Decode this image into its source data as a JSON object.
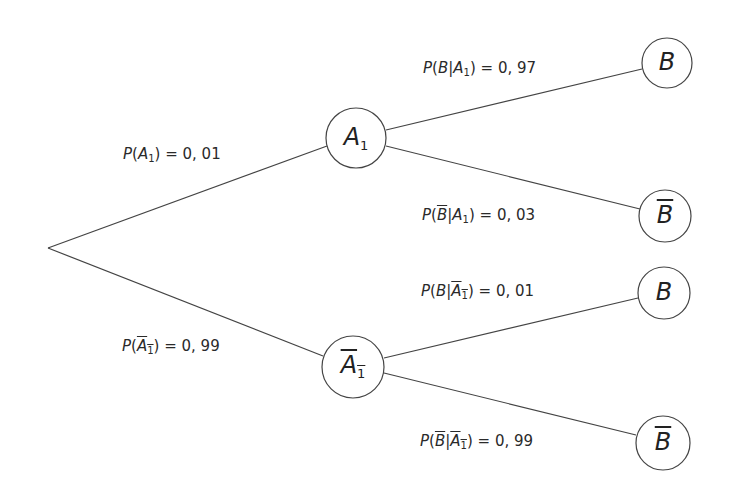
{
  "diagram": {
    "type": "probability-tree",
    "root": {
      "x": 48,
      "y": 248
    },
    "nodes": [
      {
        "id": "A1",
        "label": "A",
        "sub": "1",
        "overline": false,
        "x": 356,
        "y": 138,
        "r": 30
      },
      {
        "id": "notA1",
        "label": "A",
        "sub": "1",
        "overline": true,
        "x": 353,
        "y": 367,
        "r": 31
      },
      {
        "id": "B_A1",
        "label": "B",
        "overline": false,
        "x": 667,
        "y": 63,
        "r": 25
      },
      {
        "id": "notB_A1",
        "label": "B",
        "overline": true,
        "x": 665,
        "y": 216,
        "r": 26
      },
      {
        "id": "B_notA1",
        "label": "B",
        "overline": false,
        "x": 664,
        "y": 293,
        "r": 26
      },
      {
        "id": "notB_notA1",
        "label": "B",
        "overline": true,
        "x": 663,
        "y": 443,
        "r": 27
      }
    ],
    "edges": [
      {
        "from": "root",
        "to": "A1",
        "label": "P(A1) = 0,01",
        "value": "0, 01"
      },
      {
        "from": "root",
        "to": "notA1",
        "label": "P(not A1) = 0,99",
        "value": "0, 99"
      },
      {
        "from": "A1",
        "to": "B_A1",
        "label": "P(B|A1) = 0,97",
        "value": "0, 97"
      },
      {
        "from": "A1",
        "to": "notB_A1",
        "label": "P(not B|A1) = 0,03",
        "value": "0, 03"
      },
      {
        "from": "notA1",
        "to": "B_notA1",
        "label": "P(B|not A1) = 0,01",
        "value": "0, 01"
      },
      {
        "from": "notA1",
        "to": "notB_notA1",
        "label": "P(not B|not A1) = 0,99",
        "value": "0, 99"
      }
    ],
    "text": {
      "P": "P",
      "A": "A",
      "B": "B",
      "one": "1",
      "open": "(",
      "close": ")",
      "bar": "|",
      "eq": " = ",
      "v_A1": "0, 01",
      "v_notA1": "0, 99",
      "v_B_A1": "0, 97",
      "v_notB_A1": "0, 03",
      "v_B_notA1": "0, 01",
      "v_notB_notA1": "0, 99"
    },
    "stroke_color": "#444444"
  }
}
